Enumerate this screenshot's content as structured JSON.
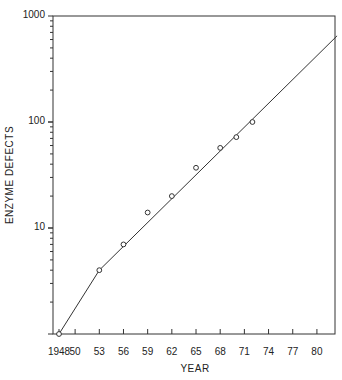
{
  "chart_data": {
    "type": "line",
    "title": "",
    "xlabel": "YEAR",
    "ylabel": "ENZYME DEFECTS",
    "yscale": "log",
    "ylim": [
      1,
      1000
    ],
    "xlim": [
      1947.5,
      1982.5
    ],
    "grid": false,
    "legend": null,
    "x_ticks": [
      1948,
      1950,
      1953,
      1956,
      1959,
      1962,
      1965,
      1968,
      1971,
      1974,
      1977,
      1980
    ],
    "x_tick_labels": [
      "1948",
      "50",
      "53",
      "56",
      "59",
      "62",
      "65",
      "68",
      "71",
      "74",
      "77",
      "80"
    ],
    "y_tick_labels": [
      "1000",
      "100",
      "10"
    ],
    "series": [
      {
        "name": "observed",
        "marker": "open-circle",
        "x": [
          1948,
          1953,
          1956,
          1959,
          1962,
          1965,
          1968,
          1970,
          1972
        ],
        "y": [
          1,
          4,
          7,
          14,
          20,
          37,
          57,
          72,
          100
        ]
      },
      {
        "name": "trend line",
        "marker": "none",
        "x": [
          1948,
          1953,
          1982.5
        ],
        "y": [
          1,
          4,
          650
        ]
      }
    ]
  }
}
